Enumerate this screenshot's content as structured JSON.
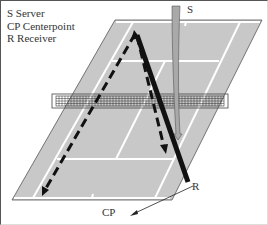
{
  "legend": {
    "items": [
      {
        "key": "S",
        "label": "S Server"
      },
      {
        "key": "CP",
        "label": "CP Centerpoint"
      },
      {
        "key": "R",
        "label": "R Receiver"
      }
    ]
  },
  "labels": {
    "server": "S",
    "receiver": "R",
    "centerpoint": "CP"
  },
  "colors": {
    "court": "#c8c8c8",
    "lines": "#ffffff",
    "paths": "#111111",
    "server_arrow": "#a9a9a9"
  }
}
